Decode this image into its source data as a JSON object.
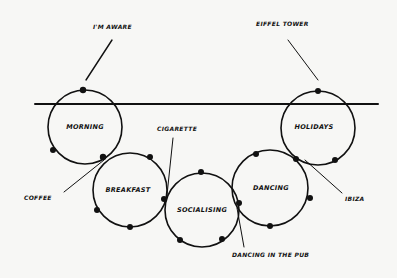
{
  "diagram": {
    "type": "hand-drawn linked life-event circles",
    "ink_color": "#111111",
    "background": "#f7f7f5",
    "timeline": {
      "x1": 35,
      "x2": 378,
      "y": 104
    },
    "circles": [
      {
        "id": "morning",
        "label": "MORNING",
        "cx": 85,
        "cy": 127,
        "r": 37
      },
      {
        "id": "breakfast",
        "label": "BREAKFAST",
        "cx": 130,
        "cy": 190,
        "r": 37
      },
      {
        "id": "socialising",
        "label": "SOCIALISING",
        "cx": 202,
        "cy": 210,
        "r": 37
      },
      {
        "id": "dancing",
        "label": "DANCING",
        "cx": 270,
        "cy": 188,
        "r": 38
      },
      {
        "id": "holidays",
        "label": "HOLIDAYS",
        "cx": 318,
        "cy": 128,
        "r": 37
      }
    ],
    "annotations": [
      {
        "id": "im-aware",
        "label": "I'M AWARE",
        "x": 93,
        "y": 29
      },
      {
        "id": "eiffel-tower",
        "label": "EIFFEL TOWER",
        "x": 256,
        "y": 26
      },
      {
        "id": "cigarette",
        "label": "CIGARETTE",
        "x": 157,
        "y": 131
      },
      {
        "id": "coffee",
        "label": "COFFEE",
        "x": 24,
        "y": 200
      },
      {
        "id": "ibiza",
        "label": "IBIZA",
        "x": 345,
        "y": 201
      },
      {
        "id": "dancing-in-the-pub",
        "label": "DANCING IN THE PUB",
        "x": 232,
        "y": 257
      }
    ]
  }
}
